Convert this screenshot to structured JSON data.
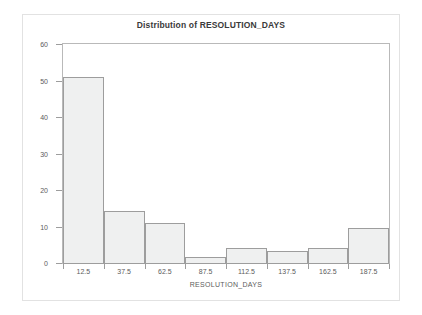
{
  "chart_data": {
    "type": "bar",
    "title": "Distribution of RESOLUTION_DAYS",
    "xlabel": "RESOLUTION_DAYS",
    "ylabel": "Percent",
    "categories": [
      "12.5",
      "37.5",
      "62.5",
      "87.5",
      "112.5",
      "137.5",
      "162.5",
      "187.5"
    ],
    "values": [
      51.3,
      14.4,
      11.3,
      2.0,
      4.4,
      3.7,
      4.4,
      9.8
    ],
    "ylim": [
      0,
      60
    ],
    "yticks": [
      "0",
      "10",
      "20",
      "30",
      "40",
      "50",
      "60"
    ],
    "ytick_values": [
      0,
      10,
      20,
      30,
      40,
      50,
      60
    ],
    "grid": false,
    "legend": false,
    "bar_fill_color": "#eff0f0",
    "bar_border_color": "#9d9d9d",
    "axis_color": "#9d9d9d",
    "text_color": "#5c5c5c",
    "title_color": "#3a3a3a",
    "background_color": "#ffffff"
  }
}
